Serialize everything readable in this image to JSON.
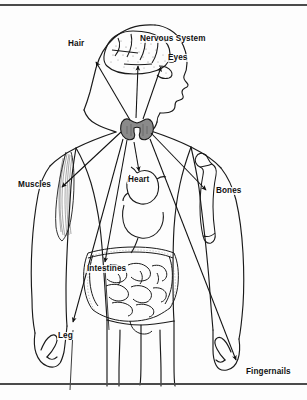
{
  "figure": {
    "width": 307,
    "height": 400,
    "background_color": "#fdfdfd",
    "line_color": "#1a1a1a",
    "text_color": "#111111",
    "thyroid_color": "#8a8a8a"
  },
  "rules": {
    "top": {
      "name": "top-rule",
      "color": "#4b4b4b"
    },
    "bottom": {
      "name": "bottom-rule",
      "color": "#4b4b4b"
    }
  },
  "labels": [
    {
      "id": "hair",
      "text": "Hair",
      "x": 67,
      "y": 45,
      "anchor": "start"
    },
    {
      "id": "nervous-system",
      "text": "Nervous System",
      "x": 139,
      "y": 40,
      "anchor": "start"
    },
    {
      "id": "eyes",
      "text": "Eyes",
      "x": 167,
      "y": 59,
      "anchor": "start"
    },
    {
      "id": "muscles",
      "text": "Muscles",
      "x": 17,
      "y": 186,
      "anchor": "start"
    },
    {
      "id": "heart",
      "text": "Heart",
      "x": 127,
      "y": 181,
      "anchor": "start"
    },
    {
      "id": "bones",
      "text": "Bones",
      "x": 215,
      "y": 192,
      "anchor": "start"
    },
    {
      "id": "intestines",
      "text": "Intestines",
      "x": 86,
      "y": 270,
      "anchor": "start"
    },
    {
      "id": "leg",
      "text": "Leg",
      "x": 57,
      "y": 337,
      "anchor": "start"
    },
    {
      "id": "fingernails",
      "text": "Fingernails",
      "x": 245,
      "y": 373,
      "anchor": "start"
    }
  ],
  "organs": [
    {
      "id": "brain",
      "name": "brain"
    },
    {
      "id": "thyroid",
      "name": "thyroid-gland"
    },
    {
      "id": "heart",
      "name": "heart"
    },
    {
      "id": "intestines",
      "name": "intestines"
    },
    {
      "id": "bicep",
      "name": "bicep-muscle"
    },
    {
      "id": "humerus",
      "name": "humerus-bone"
    },
    {
      "id": "hand",
      "name": "hand"
    }
  ]
}
